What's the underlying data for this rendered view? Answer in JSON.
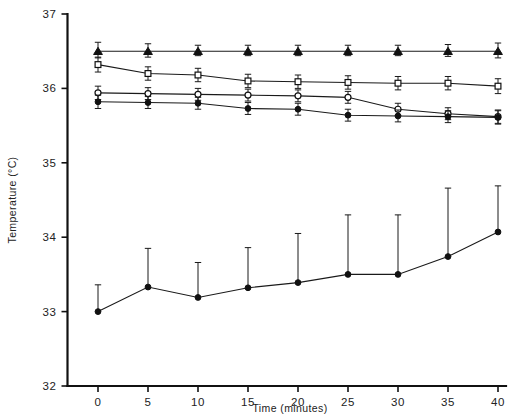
{
  "chart_data": {
    "type": "line",
    "title": "",
    "xlabel": "Time (minutes)",
    "ylabel": "Temperature (°C)",
    "x": [
      0,
      5,
      10,
      15,
      20,
      25,
      30,
      35,
      40
    ],
    "xticklabels": [
      "0",
      "5",
      "10",
      "15",
      "20",
      "25",
      "30",
      "35",
      "40"
    ],
    "yticklabels": [
      "32",
      "33",
      "34",
      "35",
      "36",
      "37"
    ],
    "yticks": [
      32,
      33,
      34,
      35,
      36,
      37
    ],
    "xlim": [
      0,
      40
    ],
    "ylim": [
      32,
      37
    ],
    "grid": false,
    "legend": "none",
    "series": [
      {
        "name": "filled-triangle-series",
        "marker": "filled-triangle",
        "values": [
          36.5,
          36.5,
          36.5,
          36.5,
          36.5,
          36.5,
          36.5,
          36.5,
          36.5
        ],
        "err_up": [
          0.12,
          0.1,
          0.08,
          0.08,
          0.08,
          0.08,
          0.08,
          0.09,
          0.11
        ],
        "err_down": [
          0.09,
          0.08,
          0.06,
          0.06,
          0.06,
          0.06,
          0.06,
          0.07,
          0.09
        ]
      },
      {
        "name": "open-square-series",
        "marker": "open-square",
        "values": [
          36.32,
          36.2,
          36.18,
          36.1,
          36.09,
          36.08,
          36.07,
          36.07,
          36.03
        ],
        "err_up": [
          0.1,
          0.09,
          0.09,
          0.09,
          0.09,
          0.09,
          0.09,
          0.09,
          0.1
        ],
        "err_down": [
          0.1,
          0.09,
          0.09,
          0.09,
          0.09,
          0.09,
          0.09,
          0.09,
          0.1
        ]
      },
      {
        "name": "open-circle-series",
        "marker": "open-circle",
        "values": [
          35.94,
          35.93,
          35.92,
          35.91,
          35.9,
          35.88,
          35.72,
          35.66,
          35.62
        ],
        "err_up": [
          0.09,
          0.08,
          0.08,
          0.08,
          0.08,
          0.08,
          0.08,
          0.08,
          0.09
        ],
        "err_down": [
          0.09,
          0.08,
          0.08,
          0.08,
          0.08,
          0.08,
          0.08,
          0.08,
          0.09
        ]
      },
      {
        "name": "filled-circle-upper-series",
        "marker": "filled-circle",
        "values": [
          35.82,
          35.81,
          35.8,
          35.73,
          35.72,
          35.64,
          35.63,
          35.62,
          35.61
        ],
        "err_up": [
          0.09,
          0.08,
          0.08,
          0.08,
          0.08,
          0.08,
          0.08,
          0.08,
          0.09
        ],
        "err_down": [
          0.09,
          0.08,
          0.08,
          0.08,
          0.08,
          0.08,
          0.08,
          0.08,
          0.09
        ]
      },
      {
        "name": "filled-circle-lower-series",
        "marker": "filled-circle",
        "values": [
          33.0,
          33.33,
          33.19,
          33.32,
          33.39,
          33.5,
          33.5,
          33.74,
          34.07
        ],
        "err_up": [
          0.36,
          0.52,
          0.47,
          0.54,
          0.66,
          0.8,
          0.8,
          0.92,
          0.62
        ],
        "err_down": [
          0.0,
          0.0,
          0.0,
          0.0,
          0.0,
          0.0,
          0.0,
          0.0,
          0.0
        ]
      }
    ]
  },
  "axes": {
    "y_title": "Temperature (°C)",
    "x_title": "Time (minutes)"
  }
}
